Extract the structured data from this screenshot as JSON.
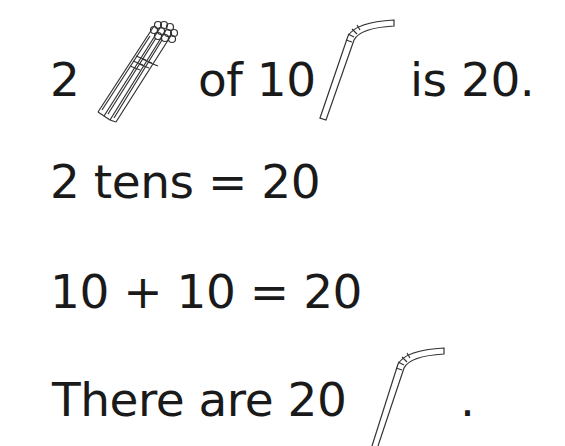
{
  "lines": {
    "line1": {
      "number": "2",
      "mid": "of 10",
      "end": "is 20."
    },
    "line2": {
      "text": "2 tens = 20"
    },
    "line3": {
      "text": "10 + 10 = 20"
    },
    "line4": {
      "text": "There are 20",
      "end": "."
    }
  },
  "icons": {
    "bundle": "bundle-of-ten-straws-icon",
    "straw": "bendy-straw-icon"
  }
}
